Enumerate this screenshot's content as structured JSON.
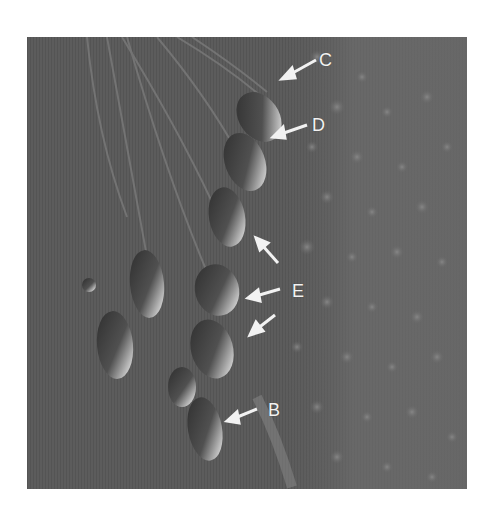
{
  "figure": {
    "background_color": "#5a5a5a",
    "label_color": "#f2f2f2",
    "labels": [
      {
        "id": "C",
        "text": "C",
        "x": 319,
        "y": 51
      },
      {
        "id": "D",
        "text": "D",
        "x": 312,
        "y": 116
      },
      {
        "id": "E",
        "text": "E",
        "x": 292,
        "y": 282
      },
      {
        "id": "B",
        "text": "B",
        "x": 268,
        "y": 401
      }
    ],
    "arrows": [
      {
        "label": "C",
        "from": [
          316,
          60
        ],
        "to": [
          285,
          77
        ]
      },
      {
        "label": "D",
        "from": [
          307,
          125
        ],
        "to": [
          275,
          135
        ]
      },
      {
        "label": "E",
        "from": [
          278,
          262
        ],
        "to": [
          256,
          238
        ]
      },
      {
        "label": "E",
        "from": [
          280,
          290
        ],
        "to": [
          250,
          300
        ]
      },
      {
        "label": "E",
        "from": [
          275,
          315
        ],
        "to": [
          250,
          335
        ]
      },
      {
        "label": "B",
        "from": [
          257,
          408
        ],
        "to": [
          225,
          422
        ]
      }
    ]
  }
}
